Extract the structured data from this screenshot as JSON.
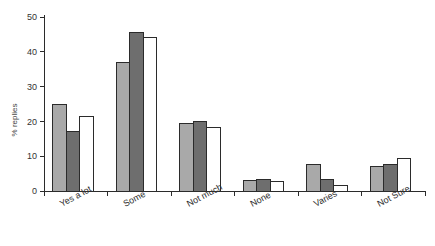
{
  "chart_data": {
    "type": "bar",
    "title": "",
    "subtitle": "",
    "xlabel": "",
    "ylabel": "% replies",
    "categories": [
      "Yes a lot",
      "Some",
      "Not much",
      "None",
      "Varies",
      "Not Sure"
    ],
    "series": [
      {
        "name": "series-1",
        "color": "#a9a9a9",
        "values": [
          25.0,
          36.8,
          19.5,
          3.0,
          7.5,
          7.0
        ]
      },
      {
        "name": "series-2",
        "color": "#6e6e6e",
        "values": [
          17.2,
          45.5,
          20.1,
          3.4,
          3.4,
          7.5
        ]
      },
      {
        "name": "series-3",
        "color": "#ffffff",
        "values": [
          21.5,
          44.2,
          18.2,
          2.6,
          1.6,
          9.2
        ]
      }
    ],
    "ylim": [
      0,
      50
    ],
    "yticks": [
      0,
      10,
      20,
      30,
      40,
      50
    ],
    "ytick_labels": [
      "0",
      "10",
      "20",
      "30",
      "40",
      "50"
    ],
    "grid": false,
    "legend": "none",
    "bar_edge_color": "#2b2b2b"
  },
  "axes": {
    "y_axis_name": "y-axis",
    "x_axis_name": "x-axis"
  }
}
